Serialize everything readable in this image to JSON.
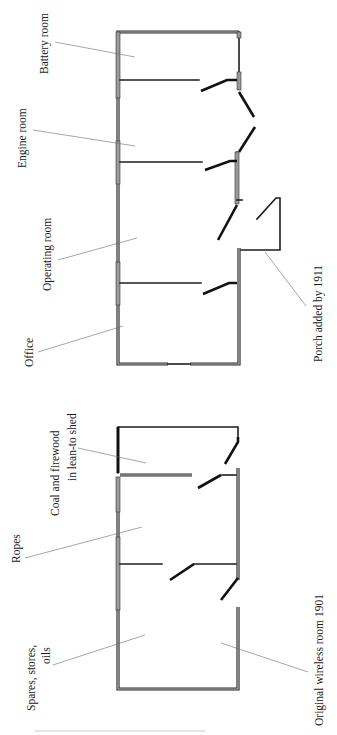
{
  "upper_plan": {
    "labels": {
      "battery_room": "Battery room",
      "engine_room": "Engine room",
      "operating_room": "Operating room",
      "office": "Office",
      "porch": "Porch added by 1911"
    }
  },
  "lower_plan": {
    "labels": {
      "coal_line1": "Coal and firewood",
      "coal_line2": "in lean-to shed",
      "ropes": "Ropes",
      "spares_line1": "Spares, stores,",
      "spares_line2": "oils",
      "wireless": "Original wireless room 1901"
    }
  },
  "colors": {
    "wall": "#1e1e1e",
    "window_fill": "#9a9a9a",
    "leader": "#6b6b6b",
    "background": "#ffffff"
  }
}
